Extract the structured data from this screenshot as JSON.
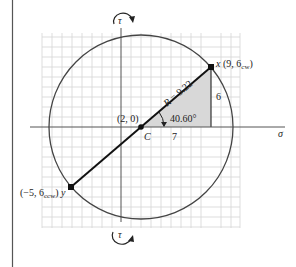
{
  "diagram": {
    "type": "mohr-circle",
    "axes": {
      "horizontal_label": "σ",
      "vertical_top_label": "τ",
      "vertical_bottom_label": "τ"
    },
    "center": {
      "coords_label": "(2, 0)",
      "name": "C"
    },
    "radius_label": "R = 9.22",
    "angle_label": "40.60°",
    "triangle": {
      "base_label": "7",
      "height_label": "6"
    },
    "point_x": {
      "name": "x",
      "coords_label": "(9, 6",
      "subscript": "cw",
      "close": ")"
    },
    "point_y": {
      "name": "y",
      "coords_label": "(−5, 6",
      "subscript": "ccw",
      "close": ")"
    },
    "colors": {
      "circle": "#444444",
      "diameter": "#111111",
      "grid": "#d4d4d4",
      "shading": "#d8d8d8",
      "axis": "#555555"
    }
  }
}
